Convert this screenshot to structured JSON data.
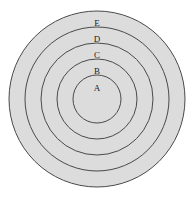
{
  "diagram": {
    "type": "concentric-circles",
    "canvas": {
      "width": 193,
      "height": 197,
      "background": "#ffffff"
    },
    "center": {
      "x": 97,
      "y": 99
    },
    "style": {
      "fill": "#dcdcdc",
      "stroke": "#4a4a4a",
      "stroke_width": 1,
      "label_color": "#1c1c1c",
      "label_font_size": 9
    },
    "rings": [
      {
        "label": "E",
        "radius": 88,
        "label_x": 97,
        "label_y": 23,
        "fill": "#dcdcdc",
        "stroke": "#4a4a4a"
      },
      {
        "label": "D",
        "radius": 72,
        "label_x": 97,
        "label_y": 39,
        "fill": "#dcdcdc",
        "stroke": "#4a4a4a"
      },
      {
        "label": "C",
        "radius": 56,
        "label_x": 97,
        "label_y": 55,
        "fill": "#dcdcdc",
        "stroke": "#4a4a4a"
      },
      {
        "label": "B",
        "radius": 40,
        "label_x": 97,
        "label_y": 71,
        "fill": "#dcdcdc",
        "stroke": "#4a4a4a"
      },
      {
        "label": "A",
        "radius": 24,
        "label_x": 97,
        "label_y": 88,
        "fill": "#dcdcdc",
        "stroke": "#4a4a4a"
      }
    ]
  }
}
